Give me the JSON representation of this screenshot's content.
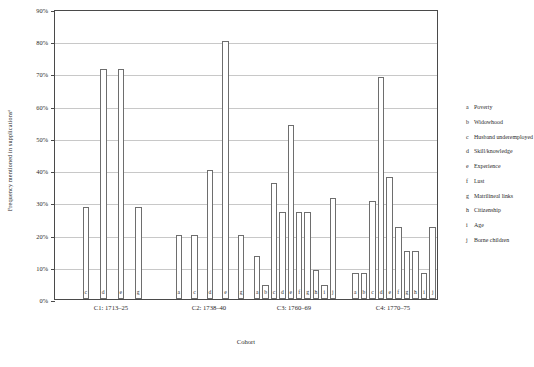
{
  "chart_data": {
    "type": "bar",
    "title": "",
    "xlabel": "Cohort",
    "ylabel": "Frequency mentioned in supplicationsᵃ",
    "ylim": [
      0,
      90
    ],
    "ytick_labels": [
      "0%",
      "10%",
      "20%",
      "30%",
      "40%",
      "50%",
      "60%",
      "70%",
      "80%",
      "90%"
    ],
    "ytick_values": [
      0,
      10,
      20,
      30,
      40,
      50,
      60,
      70,
      80,
      90
    ],
    "grid": true,
    "legend_position": "right",
    "categories": [
      "C1: 1713–25",
      "C2: 1738–40",
      "C3: 1760–69",
      "C4: 1770–75"
    ],
    "series_keys": [
      "a",
      "b",
      "c",
      "d",
      "e",
      "f",
      "g",
      "h",
      "i",
      "j"
    ],
    "groups": [
      {
        "label": "C1: 1713–25",
        "bars": [
          {
            "code": "c",
            "value": 28.5
          },
          {
            "code": "d",
            "value": 71.5
          },
          {
            "code": "e",
            "value": 71.5
          },
          {
            "code": "g",
            "value": 28.5
          }
        ]
      },
      {
        "label": "C2: 1738–40",
        "bars": [
          {
            "code": "a",
            "value": 20
          },
          {
            "code": "c",
            "value": 20
          },
          {
            "code": "d",
            "value": 40
          },
          {
            "code": "e",
            "value": 80
          },
          {
            "code": "g",
            "value": 20
          }
        ]
      },
      {
        "label": "C3: 1760–69",
        "bars": [
          {
            "code": "a",
            "value": 13.5
          },
          {
            "code": "b",
            "value": 4.5
          },
          {
            "code": "c",
            "value": 36
          },
          {
            "code": "d",
            "value": 27
          },
          {
            "code": "e",
            "value": 54
          },
          {
            "code": "f",
            "value": 27
          },
          {
            "code": "g",
            "value": 27
          },
          {
            "code": "h",
            "value": 9
          },
          {
            "code": "i",
            "value": 4.5
          },
          {
            "code": "j",
            "value": 31.5
          }
        ]
      },
      {
        "label": "C4: 1770–75",
        "bars": [
          {
            "code": "a",
            "value": 8
          },
          {
            "code": "b",
            "value": 8
          },
          {
            "code": "c",
            "value": 30.5
          },
          {
            "code": "d",
            "value": 69
          },
          {
            "code": "e",
            "value": 38
          },
          {
            "code": "f",
            "value": 22.5
          },
          {
            "code": "g",
            "value": 15
          },
          {
            "code": "h",
            "value": 15
          },
          {
            "code": "i",
            "value": 8
          },
          {
            "code": "j",
            "value": 22.5
          }
        ]
      }
    ],
    "legend": [
      {
        "key": "a",
        "label": "Poverty"
      },
      {
        "key": "b",
        "label": "Widowhood"
      },
      {
        "key": "c",
        "label": "Husband underemployed"
      },
      {
        "key": "d",
        "label": "Skill/knowledge"
      },
      {
        "key": "e",
        "label": "Experience"
      },
      {
        "key": "f",
        "label": "Lust"
      },
      {
        "key": "g",
        "label": "Matrilineal links"
      },
      {
        "key": "h",
        "label": "Citizenship"
      },
      {
        "key": "i",
        "label": "Age"
      },
      {
        "key": "j",
        "label": "Borne children"
      }
    ],
    "colors": {
      "bar_fill": "#ffffff",
      "bar_stroke": "#6e6e6e",
      "axis": "#4a4a4a",
      "grid": "#c8c8c8",
      "text": "#2b2b2b"
    }
  }
}
